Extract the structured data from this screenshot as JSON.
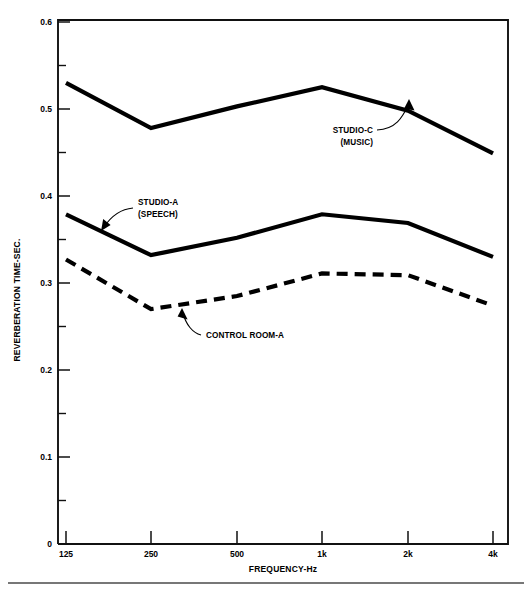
{
  "chart_data": {
    "type": "line",
    "title": "",
    "xlabel": "FREQUENCY-Hz",
    "ylabel": "REVERBERATION TIME-SEC.",
    "categories": [
      "125",
      "250",
      "500",
      "1k",
      "2k",
      "4k"
    ],
    "x_tick_labels": [
      "125",
      "250",
      "500",
      "1k",
      "2k",
      "4k"
    ],
    "y_tick_labels": [
      "0",
      "0.1",
      "0.2",
      "0.3",
      "0.4",
      "0.5",
      "0.6"
    ],
    "y_tick_values": [
      0,
      0.1,
      0.2,
      0.3,
      0.4,
      0.5,
      0.6
    ],
    "y_minor_tick_values": [
      0.05,
      0.15,
      0.25,
      0.35,
      0.45,
      0.55
    ],
    "ylim": [
      0,
      0.6
    ],
    "grid": false,
    "legend_position": "inline-annotations",
    "series": [
      {
        "name": "STUDIO-C (MUSIC)",
        "style": "solid",
        "color": "#000000",
        "values": [
          0.53,
          0.478,
          0.503,
          0.525,
          0.498,
          0.449
        ]
      },
      {
        "name": "STUDIO-A (SPEECH)",
        "style": "solid",
        "color": "#000000",
        "values": [
          0.379,
          0.332,
          0.352,
          0.379,
          0.369,
          0.33
        ]
      },
      {
        "name": "CONTROL ROOM-A",
        "style": "dashed",
        "color": "#000000",
        "values": [
          0.327,
          0.27,
          0.285,
          0.311,
          0.309,
          0.274
        ]
      }
    ],
    "annotations": [
      {
        "id": "studio-c",
        "line1": "STUDIO-C",
        "line2": "(MUSIC)",
        "points_to_series": "STUDIO-C (MUSIC)",
        "points_to_category": "2k"
      },
      {
        "id": "studio-a",
        "line1": "STUDIO-A",
        "line2": "(SPEECH)",
        "points_to_series": "STUDIO-A (SPEECH)",
        "points_to_category": "125-250"
      },
      {
        "id": "control-room-a",
        "line1": "CONTROL ROOM-A",
        "line2": "",
        "points_to_series": "CONTROL ROOM-A",
        "points_to_category": "250-500"
      }
    ]
  },
  "axes": {
    "y_labels": {
      "t0": "0",
      "t1": "0.1",
      "t2": "0.2",
      "t3": "0.3",
      "t4": "0.4",
      "t5": "0.5",
      "t6": "0.6"
    },
    "x_labels": {
      "t0": "125",
      "t1": "250",
      "t2": "500",
      "t3": "1k",
      "t4": "2k",
      "t5": "4k"
    },
    "x_title": "FREQUENCY-Hz",
    "y_title": "REVERBERATION TIME-SEC."
  },
  "annotations_text": {
    "studio_c_line1": "STUDIO-C",
    "studio_c_line2": "(MUSIC)",
    "studio_a_line1": "STUDIO-A",
    "studio_a_line2": "(SPEECH)",
    "control_room_a": "CONTROL ROOM-A"
  },
  "colors": {
    "ink": "#000000",
    "axis": "#111111",
    "rule": "#4a4a4a",
    "background": "#ffffff"
  }
}
